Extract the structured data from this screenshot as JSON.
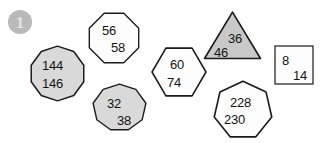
{
  "exercise": {
    "badge_number": "1",
    "badge_color": "#b9b9b9",
    "badge_text_color": "#e4e4e4"
  },
  "palette": {
    "shaded_fill": "#d9d9d9",
    "plain_fill": "#fdfdfd",
    "stroke": "#1a1a1a",
    "page_background": "#ffffff",
    "number_color": "#141414"
  },
  "shapes": [
    {
      "name": "decagon-144-146",
      "polygon": "decagon",
      "sides": 10,
      "fill": "shaded",
      "top_number": "144",
      "bottom_number": "146"
    },
    {
      "name": "octagon-56-58",
      "polygon": "octagon",
      "sides": 8,
      "fill": "plain",
      "top_number": "56",
      "bottom_number": "58"
    },
    {
      "name": "nonagon-32-38",
      "polygon": "nonagon",
      "sides": 9,
      "fill": "shaded",
      "top_number": "32",
      "bottom_number": "38"
    },
    {
      "name": "hexagon-60-74",
      "polygon": "hexagon",
      "sides": 6,
      "fill": "plain",
      "top_number": "60",
      "bottom_number": "74"
    },
    {
      "name": "triangle-36-46",
      "polygon": "triangle",
      "sides": 3,
      "fill": "shaded",
      "top_number": "36",
      "bottom_number": "46"
    },
    {
      "name": "heptagon-228-230",
      "polygon": "heptagon",
      "sides": 7,
      "fill": "plain",
      "top_number": "228",
      "bottom_number": "230"
    },
    {
      "name": "square-8-14",
      "polygon": "square",
      "sides": 4,
      "fill": "plain",
      "top_number": "8",
      "bottom_number": "14"
    }
  ]
}
